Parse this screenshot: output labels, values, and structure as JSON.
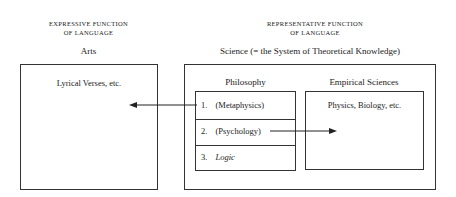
{
  "left": {
    "caption_line1": "EXPRESSIVE FUNCTION",
    "caption_line2": "OF LANGUAGE",
    "heading": "Arts",
    "box_text": "Lyrical Verses, etc."
  },
  "right": {
    "caption_line1": "REPRESENTATIVE FUNCTION",
    "caption_line2": "OF LANGUAGE",
    "heading": "Science (= the System of Theoretical Knowledge)",
    "philosophy": {
      "heading": "Philosophy",
      "items": [
        {
          "num": "1.",
          "label": "(Metaphysics)"
        },
        {
          "num": "2.",
          "label": "(Psychology)"
        },
        {
          "num": "3.",
          "label": "Logic"
        }
      ]
    },
    "empirical": {
      "heading": "Empirical Sciences",
      "box_text": "Physics, Biology, etc."
    }
  },
  "arrows": [
    {
      "from": "philosophy-item-metaphysics",
      "to": "arts-box"
    },
    {
      "from": "philosophy-item-psychology",
      "to": "empirical-sciences-box"
    }
  ]
}
